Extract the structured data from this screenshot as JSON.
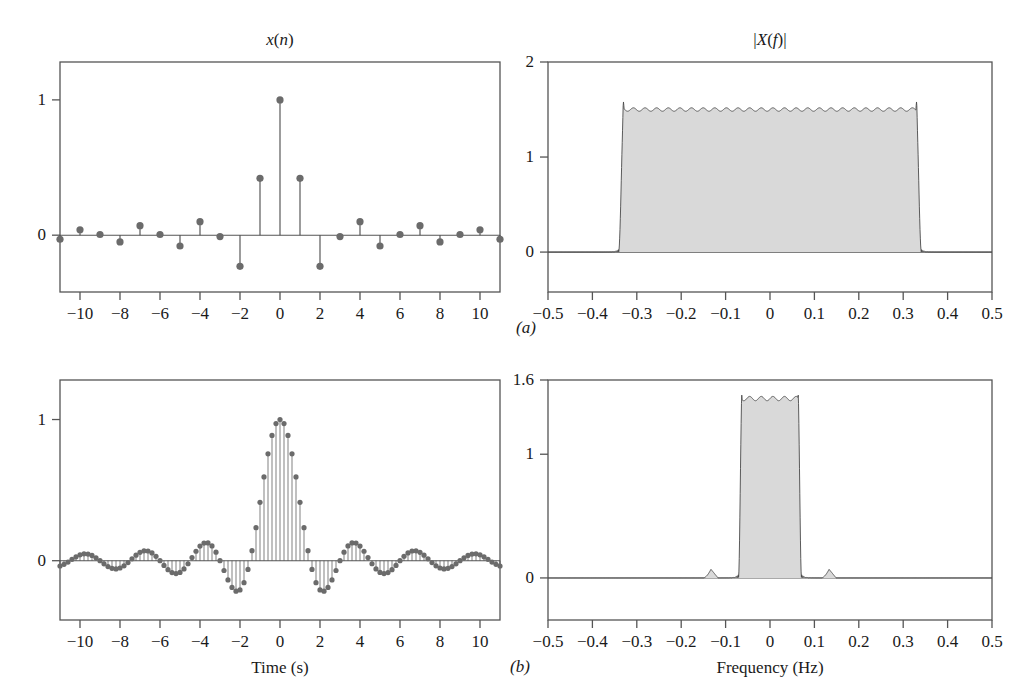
{
  "figure": {
    "panels": [
      {
        "letter": "(a)",
        "x": 516,
        "y": 318
      },
      {
        "letter": "(b)",
        "x": 510,
        "y": 657
      }
    ]
  },
  "colors": {
    "line": "#4a4a4a",
    "axis": "#555555",
    "marker": "#6b6b6b",
    "fill": "#d9d9d9",
    "text": "#1a1a1a",
    "background": "#ffffff"
  },
  "plots": {
    "top_left": {
      "title_html": "<i>x</i>(<i>n</i>)",
      "title_text": "x(n)",
      "xlabel": "",
      "ylabel": "",
      "xticks": [
        -10,
        -8,
        -6,
        -4,
        -2,
        0,
        2,
        4,
        6,
        8,
        10
      ],
      "xticklabels": [
        "−10",
        "−8",
        "−6",
        "−4",
        "−2",
        "0",
        "2",
        "4",
        "6",
        "8",
        "10"
      ],
      "yticks": [
        0,
        1
      ],
      "yticklabels": [
        "0",
        "1"
      ],
      "xlim": [
        -11,
        11
      ],
      "ylim": [
        -0.42,
        1.28
      ]
    },
    "top_right": {
      "title_html": "|<i>X</i>(<i>f</i>)|",
      "title_text": "|X(f)|",
      "xlabel": "",
      "ylabel": "",
      "xticks": [
        -0.5,
        -0.4,
        -0.3,
        -0.2,
        -0.1,
        0,
        0.1,
        0.2,
        0.3,
        0.4,
        0.5
      ],
      "xticklabels": [
        "−0.5",
        "−0.4",
        "−0.3",
        "−0.2",
        "−0.1",
        "0",
        "0.1",
        "0.2",
        "0.3",
        "0.4",
        "0.5"
      ],
      "yticks": [
        0,
        1,
        2
      ],
      "yticklabels": [
        "0",
        "1",
        "2"
      ],
      "xlim": [
        -0.5,
        0.5
      ],
      "ylim": [
        -0.42,
        2.0
      ]
    },
    "bottom_left": {
      "title_html": "",
      "title_text": "",
      "xlabel": "Time (s)",
      "ylabel": "",
      "xticks": [
        -10,
        -8,
        -6,
        -4,
        -2,
        0,
        2,
        4,
        6,
        8,
        10
      ],
      "xticklabels": [
        "−10",
        "−8",
        "−6",
        "−4",
        "−2",
        "0",
        "2",
        "4",
        "6",
        "8",
        "10"
      ],
      "yticks": [
        0,
        1
      ],
      "yticklabels": [
        "0",
        "1"
      ],
      "xlim": [
        -11,
        11
      ],
      "ylim": [
        -0.42,
        1.28
      ]
    },
    "bottom_right": {
      "title_html": "",
      "title_text": "",
      "xlabel": "Frequency (Hz)",
      "ylabel": "",
      "xticks": [
        -0.5,
        -0.4,
        -0.3,
        -0.2,
        -0.1,
        0,
        0.1,
        0.2,
        0.3,
        0.4,
        0.5
      ],
      "xticklabels": [
        "−0.5",
        "−0.4",
        "−0.3",
        "−0.2",
        "−0.1",
        "0",
        "0.1",
        "0.2",
        "0.3",
        "0.4",
        "0.5"
      ],
      "yticks": [
        0,
        1,
        1.6
      ],
      "yticklabels": [
        "0",
        "1",
        "1.6"
      ],
      "xlim": [
        -0.5,
        0.5
      ],
      "ylim": [
        -0.34,
        1.6
      ]
    }
  },
  "chart_data": [
    {
      "type": "scatter",
      "id": "top_left_stem",
      "title": "x(n)",
      "xlabel": "",
      "ylabel": "",
      "xlim": [
        -11,
        11
      ],
      "ylim": [
        -0.42,
        1.28
      ],
      "grid": false,
      "legend": null,
      "note": "Stem plot of sampled sinc sequence (ideal lowpass impulse response), sample spacing 1",
      "x": [
        -11,
        -10,
        -9,
        -8,
        -7,
        -6,
        -5,
        -4,
        -3,
        -2,
        -1,
        0,
        1,
        2,
        3,
        4,
        5,
        6,
        7,
        8,
        9,
        10,
        11
      ],
      "values": [
        -0.03,
        0.04,
        0.005,
        -0.05,
        0.07,
        0.005,
        -0.08,
        0.1,
        -0.01,
        -0.23,
        0.42,
        1.0,
        0.42,
        -0.23,
        -0.01,
        0.1,
        -0.08,
        0.005,
        0.07,
        -0.05,
        0.005,
        0.04,
        -0.03
      ]
    },
    {
      "type": "area",
      "id": "top_right_spectrum",
      "title": "|X(f)|",
      "xlabel": "",
      "ylabel": "",
      "xlim": [
        -0.5,
        0.5
      ],
      "ylim": [
        -0.42,
        2.0
      ],
      "grid": false,
      "legend": null,
      "note": "Magnitude spectrum: near-rectangular passband from -0.335 to 0.335 Hz, plateau approx 1.5, Gibbs ringing overshoot approx 1.62 at band edges",
      "passband": [
        -0.335,
        0.335
      ],
      "plateau": 1.5,
      "overshoot": 1.62,
      "stopband": 0.0
    },
    {
      "type": "scatter",
      "id": "bottom_left_stem",
      "title": "",
      "xlabel": "Time (s)",
      "ylabel": "",
      "xlim": [
        -11,
        11
      ],
      "ylim": [
        -0.42,
        1.28
      ],
      "grid": false,
      "legend": null,
      "note": "Densely sampled (interpolated) sinc, sample spacing 0.2 s, main lobe half-width approx 1.5 s, sidelobe peaks approx 0.08 decaying",
      "main_lobe_half_width": 1.5,
      "peak": 1.0,
      "first_negative_lobe": -0.22,
      "second_positive_lobe": 0.13
    },
    {
      "type": "area",
      "id": "bottom_right_spectrum",
      "title": "",
      "xlabel": "Frequency (Hz)",
      "ylabel": "",
      "xlim": [
        -0.5,
        0.5
      ],
      "ylim": [
        -0.34,
        1.6
      ],
      "grid": false,
      "legend": null,
      "note": "Magnitude spectrum after interpolation: narrow passband -0.067 to 0.067 Hz, plateau approx 1.45, small residual image spurs at +/-0.133 Hz of height approx 0.07",
      "passband": [
        -0.067,
        0.067
      ],
      "plateau": 1.45,
      "spurs": [
        {
          "f": -0.133,
          "height": 0.07
        },
        {
          "f": 0.133,
          "height": 0.07
        }
      ],
      "stopband": 0.0
    }
  ]
}
